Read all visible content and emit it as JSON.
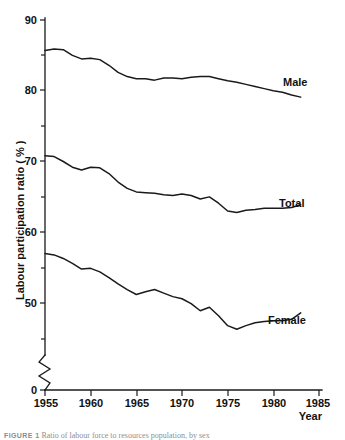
{
  "chart_data": {
    "type": "line",
    "title": "",
    "xlabel": "Year",
    "ylabel": "Labour participation ratio ( % )",
    "xlim": [
      1955,
      1985
    ],
    "ylim": [
      40,
      90
    ],
    "grid": false,
    "legend_position": "inline-right-of-series",
    "y_axis_break": true,
    "y_axis_break_note": "axis broken between 0 and the lower plotted range",
    "x_ticks_major": [
      1955,
      1960,
      1965,
      1970,
      1975,
      1980,
      1985
    ],
    "x_tick_labels": [
      "1955",
      "1960",
      "1965",
      "1970",
      "1975",
      "1980",
      "1985"
    ],
    "y_ticks_major": [
      50,
      60,
      70,
      80,
      90
    ],
    "y_tick_labels": [
      "50",
      "60",
      "70",
      "80",
      "90"
    ],
    "y_ticks_minor": [
      45,
      55,
      65,
      75,
      85
    ],
    "y_origin_label": "0",
    "x": [
      1955,
      1956,
      1957,
      1958,
      1959,
      1960,
      1961,
      1962,
      1963,
      1964,
      1965,
      1966,
      1967,
      1968,
      1969,
      1970,
      1971,
      1972,
      1973,
      1974,
      1975,
      1976,
      1977,
      1978,
      1979,
      1980,
      1981,
      1982,
      1983
    ],
    "series": [
      {
        "name": "Male",
        "label": "Male",
        "values": [
          85.7,
          85.9,
          85.8,
          85.0,
          84.5,
          84.6,
          84.4,
          83.6,
          82.6,
          82.0,
          81.7,
          81.7,
          81.5,
          81.8,
          81.8,
          81.7,
          81.9,
          82.0,
          82.0,
          81.7,
          81.4,
          81.2,
          80.9,
          80.6,
          80.3,
          80.0,
          79.8,
          79.4,
          79.1
        ]
      },
      {
        "name": "Total",
        "label": "Total",
        "values": [
          70.8,
          70.7,
          70.0,
          69.2,
          68.8,
          69.2,
          69.1,
          68.3,
          67.1,
          66.2,
          65.7,
          65.6,
          65.5,
          65.3,
          65.2,
          65.4,
          65.2,
          64.7,
          65.0,
          64.1,
          63.0,
          62.8,
          63.1,
          63.2,
          63.4,
          63.4,
          63.4,
          63.5,
          63.9
        ]
      },
      {
        "name": "Female",
        "label": "Female",
        "values": [
          57.0,
          56.8,
          56.3,
          55.6,
          54.8,
          54.9,
          54.4,
          53.6,
          52.7,
          51.9,
          51.2,
          51.6,
          51.9,
          51.4,
          50.9,
          50.6,
          49.9,
          48.9,
          49.4,
          48.2,
          46.8,
          46.3,
          46.8,
          47.2,
          47.4,
          47.5,
          47.5,
          47.7,
          48.6
        ]
      }
    ]
  },
  "axis": {
    "y_title": "Labour participation ratio ( % )",
    "x_title": "Year",
    "origin_label": "0"
  },
  "caption": {
    "figure_label": "FIGURE 1",
    "text": "Ratio of labour force to resources population, by sex"
  }
}
